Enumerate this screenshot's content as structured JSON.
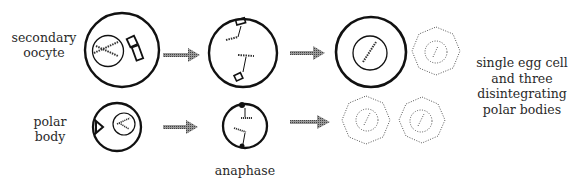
{
  "labels": {
    "secondary_oocyte": [
      "secondary",
      "oocyte"
    ],
    "polar_body": [
      "polar",
      "body"
    ],
    "anaphase": "anaphase",
    "result": [
      "single egg cell",
      "and three",
      "disintegrating",
      "polar bodies"
    ]
  },
  "stages": {
    "top_row": [
      "secondary oocyte",
      "anaphase",
      "single egg cell",
      "disintegrating polar body"
    ],
    "bottom_row": [
      "polar body",
      "anaphase",
      "disintegrating polar body",
      "disintegrating polar body"
    ]
  },
  "colors": {
    "outline": "#111111",
    "arrow": "#777777",
    "dotted": "#555555"
  }
}
